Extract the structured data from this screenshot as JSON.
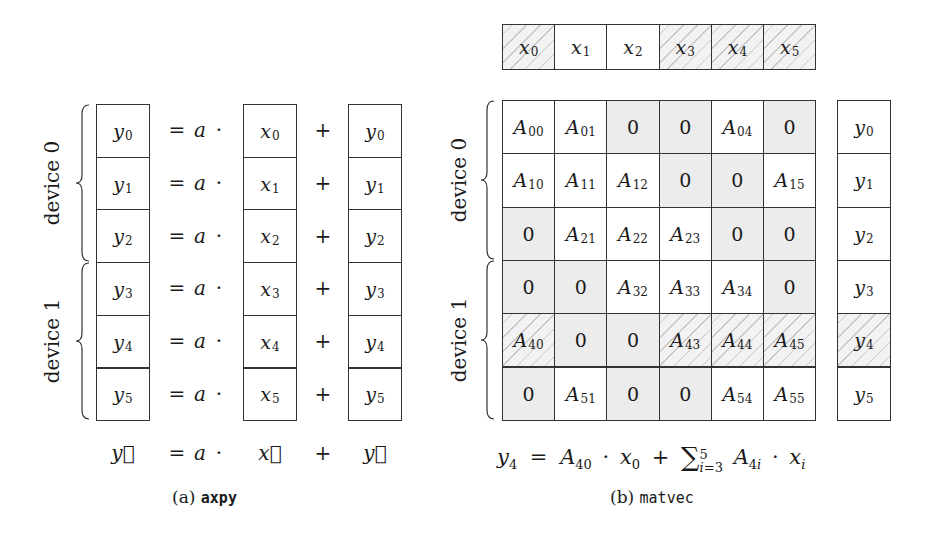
{
  "axpy": {
    "caption_prefix": "(a) ",
    "caption_code": "axpy",
    "groups": [
      {
        "label": "device 0",
        "rows": [
          0,
          1,
          2
        ]
      },
      {
        "label": "device 1",
        "rows": [
          3,
          4,
          5
        ]
      }
    ],
    "rows": [
      {
        "y": "y",
        "y_sub": "0",
        "eq": "=",
        "a": "a",
        "dot": "·",
        "x": "x",
        "x_sub": "0",
        "plus": "+",
        "y2": "y",
        "y2_sub": "0"
      },
      {
        "y": "y",
        "y_sub": "1",
        "eq": "=",
        "a": "a",
        "dot": "·",
        "x": "x",
        "x_sub": "1",
        "plus": "+",
        "y2": "y",
        "y2_sub": "1"
      },
      {
        "y": "y",
        "y_sub": "2",
        "eq": "=",
        "a": "a",
        "dot": "·",
        "x": "x",
        "x_sub": "2",
        "plus": "+",
        "y2": "y",
        "y2_sub": "2"
      },
      {
        "y": "y",
        "y_sub": "3",
        "eq": "=",
        "a": "a",
        "dot": "·",
        "x": "x",
        "x_sub": "3",
        "plus": "+",
        "y2": "y",
        "y2_sub": "3"
      },
      {
        "y": "y",
        "y_sub": "4",
        "eq": "=",
        "a": "a",
        "dot": "·",
        "x": "x",
        "x_sub": "4",
        "plus": "+",
        "y2": "y",
        "y2_sub": "4"
      },
      {
        "y": "y",
        "y_sub": "5",
        "eq": "=",
        "a": "a",
        "dot": "·",
        "x": "x",
        "x_sub": "5",
        "plus": "+",
        "y2": "y",
        "y2_sub": "5"
      }
    ],
    "summary": {
      "y": "y⃗",
      "eq": "=",
      "a": "a",
      "dot": "·",
      "x": "x⃗",
      "plus": "+",
      "y2": "y⃗"
    }
  },
  "matvec": {
    "caption_prefix": "(b) ",
    "caption_code": "matvec",
    "groups": [
      {
        "label": "device 0",
        "rows": [
          0,
          1,
          2
        ]
      },
      {
        "label": "device 1",
        "rows": [
          3,
          4,
          5
        ]
      }
    ],
    "x_vector": [
      {
        "base": "x",
        "sub": "0",
        "style": "hatch"
      },
      {
        "base": "x",
        "sub": "1",
        "style": "plain"
      },
      {
        "base": "x",
        "sub": "2",
        "style": "plain"
      },
      {
        "base": "x",
        "sub": "3",
        "style": "hatch"
      },
      {
        "base": "x",
        "sub": "4",
        "style": "hatch"
      },
      {
        "base": "x",
        "sub": "5",
        "style": "hatch"
      }
    ],
    "matrix": [
      [
        {
          "base": "A",
          "sub": "00",
          "style": "plain"
        },
        {
          "base": "A",
          "sub": "01",
          "style": "plain"
        },
        {
          "base": "0",
          "sub": "",
          "style": "shade"
        },
        {
          "base": "0",
          "sub": "",
          "style": "shade"
        },
        {
          "base": "A",
          "sub": "04",
          "style": "plain"
        },
        {
          "base": "0",
          "sub": "",
          "style": "shade"
        }
      ],
      [
        {
          "base": "A",
          "sub": "10",
          "style": "plain"
        },
        {
          "base": "A",
          "sub": "11",
          "style": "plain"
        },
        {
          "base": "A",
          "sub": "12",
          "style": "plain"
        },
        {
          "base": "0",
          "sub": "",
          "style": "shade"
        },
        {
          "base": "0",
          "sub": "",
          "style": "shade"
        },
        {
          "base": "A",
          "sub": "15",
          "style": "plain"
        }
      ],
      [
        {
          "base": "0",
          "sub": "",
          "style": "shade"
        },
        {
          "base": "A",
          "sub": "21",
          "style": "plain"
        },
        {
          "base": "A",
          "sub": "22",
          "style": "plain"
        },
        {
          "base": "A",
          "sub": "23",
          "style": "plain"
        },
        {
          "base": "0",
          "sub": "",
          "style": "shade"
        },
        {
          "base": "0",
          "sub": "",
          "style": "shade"
        }
      ],
      [
        {
          "base": "0",
          "sub": "",
          "style": "shade"
        },
        {
          "base": "0",
          "sub": "",
          "style": "shade"
        },
        {
          "base": "A",
          "sub": "32",
          "style": "plain"
        },
        {
          "base": "A",
          "sub": "33",
          "style": "plain"
        },
        {
          "base": "A",
          "sub": "34",
          "style": "plain"
        },
        {
          "base": "0",
          "sub": "",
          "style": "shade"
        }
      ],
      [
        {
          "base": "A",
          "sub": "40",
          "style": "hatch"
        },
        {
          "base": "0",
          "sub": "",
          "style": "shade"
        },
        {
          "base": "0",
          "sub": "",
          "style": "shade"
        },
        {
          "base": "A",
          "sub": "43",
          "style": "hatch"
        },
        {
          "base": "A",
          "sub": "44",
          "style": "hatch"
        },
        {
          "base": "A",
          "sub": "45",
          "style": "hatch"
        }
      ],
      [
        {
          "base": "0",
          "sub": "",
          "style": "shade"
        },
        {
          "base": "A",
          "sub": "51",
          "style": "plain"
        },
        {
          "base": "0",
          "sub": "",
          "style": "shade"
        },
        {
          "base": "0",
          "sub": "",
          "style": "shade"
        },
        {
          "base": "A",
          "sub": "54",
          "style": "plain"
        },
        {
          "base": "A",
          "sub": "55",
          "style": "plain"
        }
      ]
    ],
    "y_vector": [
      {
        "base": "y",
        "sub": "0",
        "style": "plain"
      },
      {
        "base": "y",
        "sub": "1",
        "style": "plain"
      },
      {
        "base": "y",
        "sub": "2",
        "style": "plain"
      },
      {
        "base": "y",
        "sub": "3",
        "style": "plain"
      },
      {
        "base": "y",
        "sub": "4",
        "style": "hatch"
      },
      {
        "base": "y",
        "sub": "5",
        "style": "plain"
      }
    ],
    "formula": {
      "lhs": "y",
      "lhs_sub": "4",
      "eq": "=",
      "t1": "A",
      "t1_sub": "40",
      "dot1": "·",
      "t2": "x",
      "t2_sub": "0",
      "plus": "+",
      "sum": "∑",
      "sum_sup": "5",
      "sum_sub_var": "i",
      "sum_sub_rest": "=3",
      "t3": "A",
      "t3_sub_n": "4",
      "t3_sub_i": "i",
      "dot2": "·",
      "t4": "x",
      "t4_sub": "i"
    }
  }
}
